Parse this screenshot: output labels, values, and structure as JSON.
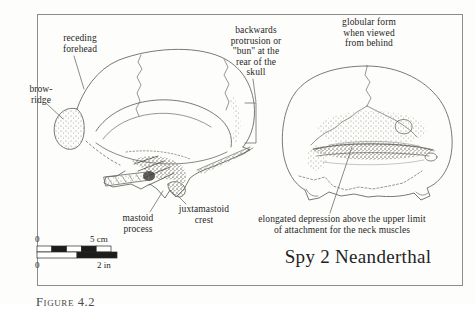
{
  "figure": {
    "title": "Spy 2 Neanderthal",
    "caption": "Figure 4.2",
    "labels": {
      "receding_forehead": "receding\nforehead",
      "brow_ridge": "brow-\nridge",
      "bun": "backwards\nprotrusion or\n\"bun\" at the\nrear of the\nskull",
      "globular_form": "globular form\nwhen viewed\nfrom behind",
      "mastoid_process": "mastoid\nprocess",
      "juxtamastoid_crest": "juxtamastoid\ncrest",
      "elongated_depression": "elongated depression above the upper limit\nof attachment for the neck muscles"
    },
    "scale_bar": {
      "cm_start": "0",
      "cm_end": "5 cm",
      "in_start": "0",
      "in_end": "2 in"
    },
    "colors": {
      "text": "#1f1f1f",
      "line_art": "#6a6a64",
      "border": "#8d8d87",
      "background": "#fdfdfb"
    }
  }
}
